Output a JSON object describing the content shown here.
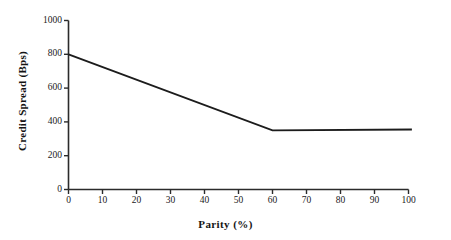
{
  "chart_data": {
    "type": "line",
    "title": "",
    "xlabel": "Parity (%)",
    "ylabel": "Credit Spread (Bps)",
    "xlim": [
      0,
      100
    ],
    "ylim": [
      0,
      1000
    ],
    "xticks": [
      0,
      10,
      20,
      30,
      40,
      50,
      60,
      70,
      80,
      90,
      100
    ],
    "xtick_labels": [
      "0",
      "10",
      "20",
      "30",
      "40",
      "50",
      "60",
      "70",
      "80",
      "90",
      "100"
    ],
    "yticks": [
      0,
      200,
      400,
      600,
      800,
      1000
    ],
    "ytick_labels": [
      "0",
      "200",
      "400",
      "600",
      "800",
      "1000"
    ],
    "grid": false,
    "legend": null,
    "series": [
      {
        "name": "Credit Spread",
        "color": "#1c1c1c",
        "x": [
          0,
          60,
          101
        ],
        "values": [
          800,
          350,
          355
        ]
      }
    ],
    "annotations": []
  },
  "axes": {
    "y_axis_title": "Credit Spread (Bps)",
    "x_axis_title": "Parity (%)"
  },
  "colors": {
    "background": "#ffffff",
    "axis": "#2b2b2b",
    "line": "#1c1c1c",
    "text": "#1a1a1a"
  }
}
